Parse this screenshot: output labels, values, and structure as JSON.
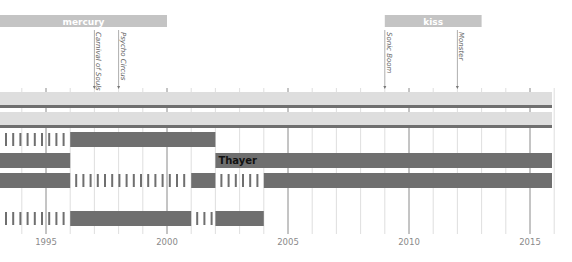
{
  "chart_data": {
    "type": "timeline",
    "title": "",
    "x_axis": {
      "min": 1993,
      "max": 2016,
      "ticks": [
        1995,
        2000,
        2005,
        2010,
        2015
      ],
      "minor_step": 1
    },
    "era_bands": [
      {
        "label": "mercury",
        "start": 1993,
        "end": 2000
      },
      {
        "label": "kiss",
        "start": 2009,
        "end": 2013
      }
    ],
    "events": [
      {
        "label": "Carnival of Souls",
        "year": 1997
      },
      {
        "label": "Psycho Circus",
        "year": 1998
      },
      {
        "label": "Sonic Boom",
        "year": 2009
      },
      {
        "label": "Monster",
        "year": 2012
      }
    ],
    "rows": [
      {
        "label": "",
        "segments": [
          {
            "start": 1993,
            "end": 2016,
            "style": "light-band-dark-base"
          }
        ]
      },
      {
        "label": "",
        "segments": [
          {
            "start": 1993,
            "end": 2016,
            "style": "light-band-dark-base"
          }
        ]
      },
      {
        "label": "",
        "segments": [
          {
            "start": 1993,
            "end": 1996,
            "style": "dashed"
          },
          {
            "start": 1996,
            "end": 2002,
            "style": "solid"
          }
        ]
      },
      {
        "label": "Thayer",
        "segments": [
          {
            "start": 1993,
            "end": 1996,
            "style": "solid"
          },
          {
            "start": 2002,
            "end": 2016,
            "style": "solid"
          }
        ]
      },
      {
        "label": "",
        "segments": [
          {
            "start": 1993,
            "end": 1996,
            "style": "solid"
          },
          {
            "start": 1996,
            "end": 2001,
            "style": "dashed"
          },
          {
            "start": 2001,
            "end": 2002,
            "style": "solid"
          },
          {
            "start": 2002,
            "end": 2004,
            "style": "dashed"
          },
          {
            "start": 2004,
            "end": 2016,
            "style": "solid"
          }
        ]
      },
      {
        "label": "",
        "segments": [
          {
            "start": 1993,
            "end": 1996,
            "style": "dashed"
          },
          {
            "start": 1996,
            "end": 2001,
            "style": "solid"
          },
          {
            "start": 2001,
            "end": 2002,
            "style": "dashed"
          },
          {
            "start": 2002,
            "end": 2004,
            "style": "solid"
          }
        ]
      }
    ],
    "colors": {
      "dark": "#6f6f6f",
      "light": "#dedede",
      "band": "#c4c4c4",
      "grid": "#d6d6d6",
      "major": "#8a8a8a",
      "text": "#8a8a8a"
    }
  }
}
